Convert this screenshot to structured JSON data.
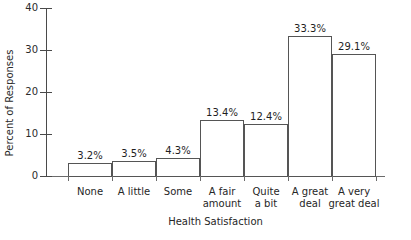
{
  "chart_data": {
    "type": "bar",
    "title": "",
    "xlabel": "Health Satisfaction",
    "ylabel": "Percent of Responses",
    "categories": [
      "None",
      "A little",
      "Some",
      "A fair amount",
      "Quite a bit",
      "A great deal",
      "A very great deal"
    ],
    "category_lines": [
      [
        "None",
        ""
      ],
      [
        "A little",
        ""
      ],
      [
        "Some",
        ""
      ],
      [
        "A fair",
        "amount"
      ],
      [
        "Quite",
        "a bit"
      ],
      [
        "A great",
        "deal"
      ],
      [
        "A very",
        "great deal"
      ]
    ],
    "values": [
      3.2,
      3.5,
      4.3,
      13.4,
      12.4,
      33.3,
      29.1
    ],
    "data_labels": [
      "3.2%",
      "3.5%",
      "4.3%",
      "13.4%",
      "12.4%",
      "33.3%",
      "29.1%"
    ],
    "ylim": [
      0,
      40
    ],
    "yticks": [
      0,
      10,
      20,
      30,
      40
    ],
    "ytick_labels": [
      "0",
      "10",
      "20",
      "30",
      "40"
    ],
    "grid": false,
    "legend": "none",
    "bar_fill": "#ffffff",
    "bar_border": "#555555",
    "axis_color": "#4a4a4a",
    "text_color": "#262626"
  }
}
